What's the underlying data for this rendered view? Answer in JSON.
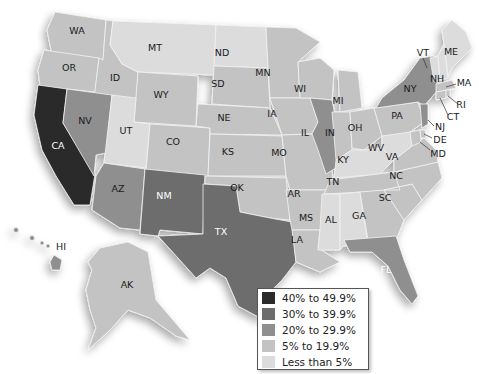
{
  "legend": {
    "items": [
      {
        "label": "40% to 49.9%",
        "color": "#2b2b2b"
      },
      {
        "label": "30% to 39.9%",
        "color": "#6d6d6d"
      },
      {
        "label": "20% to 29.9%",
        "color": "#8f8f8f"
      },
      {
        "label": "5% to 19.9%",
        "color": "#c3c3c3"
      },
      {
        "label": "Less than 5%",
        "color": "#dcdcdc"
      }
    ]
  },
  "states": {
    "WA": {
      "label": "WA",
      "bin": "5% to 19.9%"
    },
    "OR": {
      "label": "OR",
      "bin": "5% to 19.9%"
    },
    "CA": {
      "label": "CA",
      "bin": "40% to 49.9%"
    },
    "ID": {
      "label": "ID",
      "bin": "5% to 19.9%"
    },
    "NV": {
      "label": "NV",
      "bin": "20% to 29.9%"
    },
    "MT": {
      "label": "MT",
      "bin": "Less than 5%"
    },
    "WY": {
      "label": "WY",
      "bin": "5% to 19.9%"
    },
    "UT": {
      "label": "UT",
      "bin": "Less than 5%"
    },
    "AZ": {
      "label": "AZ",
      "bin": "20% to 29.9%"
    },
    "CO": {
      "label": "CO",
      "bin": "5% to 19.9%"
    },
    "NM": {
      "label": "NM",
      "bin": "30% to 39.9%"
    },
    "ND": {
      "label": "ND",
      "bin": "Less than 5%"
    },
    "SD": {
      "label": "SD",
      "bin": "5% to 19.9%"
    },
    "NE": {
      "label": "NE",
      "bin": "5% to 19.9%"
    },
    "KS": {
      "label": "KS",
      "bin": "5% to 19.9%"
    },
    "OK": {
      "label": "OK",
      "bin": "5% to 19.9%"
    },
    "TX": {
      "label": "TX",
      "bin": "30% to 39.9%"
    },
    "MN": {
      "label": "MN",
      "bin": "5% to 19.9%"
    },
    "IA": {
      "label": "IA",
      "bin": "5% to 19.9%"
    },
    "MO": {
      "label": "MO",
      "bin": "5% to 19.9%"
    },
    "AR": {
      "label": "AR",
      "bin": "5% to 19.9%"
    },
    "LA": {
      "label": "LA",
      "bin": "5% to 19.9%"
    },
    "WI": {
      "label": "WI",
      "bin": "5% to 19.9%"
    },
    "IL": {
      "label": "IL",
      "bin": "20% to 29.9%"
    },
    "MI": {
      "label": "MI",
      "bin": "5% to 19.9%"
    },
    "IN": {
      "label": "IN",
      "bin": "5% to 19.9%"
    },
    "OH": {
      "label": "OH",
      "bin": "5% to 19.9%"
    },
    "KY": {
      "label": "KY",
      "bin": "Less than 5%"
    },
    "TN": {
      "label": "TN",
      "bin": "5% to 19.9%"
    },
    "MS": {
      "label": "MS",
      "bin": "Less than 5%"
    },
    "AL": {
      "label": "AL",
      "bin": "Less than 5%"
    },
    "GA": {
      "label": "GA",
      "bin": "5% to 19.9%"
    },
    "FL": {
      "label": "FL",
      "bin": "20% to 29.9%"
    },
    "SC": {
      "label": "SC",
      "bin": "5% to 19.9%"
    },
    "NC": {
      "label": "NC",
      "bin": "5% to 19.9%"
    },
    "VA": {
      "label": "VA",
      "bin": "5% to 19.9%"
    },
    "WV": {
      "label": "WV",
      "bin": "Less than 5%"
    },
    "PA": {
      "label": "PA",
      "bin": "5% to 19.9%"
    },
    "NY": {
      "label": "NY",
      "bin": "20% to 29.9%"
    },
    "VT": {
      "label": "VT",
      "bin": "Less than 5%"
    },
    "NH": {
      "label": "NH",
      "bin": "Less than 5%"
    },
    "ME": {
      "label": "ME",
      "bin": "Less than 5%"
    },
    "MA": {
      "label": "MA",
      "bin": "5% to 19.9%"
    },
    "RI": {
      "label": "RI",
      "bin": "5% to 19.9%"
    },
    "CT": {
      "label": "CT",
      "bin": "5% to 19.9%"
    },
    "NJ": {
      "label": "NJ",
      "bin": "20% to 29.9%"
    },
    "DE": {
      "label": "DE",
      "bin": "5% to 19.9%"
    },
    "MD": {
      "label": "MD",
      "bin": "5% to 19.9%"
    },
    "AK": {
      "label": "AK",
      "bin": "5% to 19.9%"
    },
    "HI": {
      "label": "HI",
      "bin": "20% to 29.9%"
    }
  }
}
